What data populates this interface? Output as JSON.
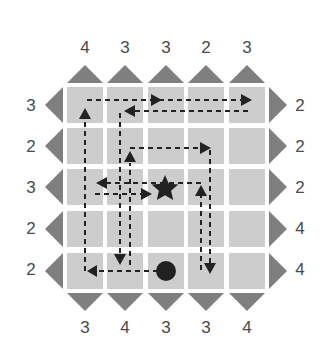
{
  "puzzle": {
    "type": "skyscraper-path-grid",
    "rows": 5,
    "cols": 5,
    "clues": {
      "top": [
        "4",
        "3",
        "3",
        "2",
        "3"
      ],
      "bottom": [
        "3",
        "4",
        "3",
        "3",
        "4"
      ],
      "left": [
        "3",
        "2",
        "3",
        "2",
        "2"
      ],
      "right": [
        "2",
        "2",
        "2",
        "4",
        "4"
      ]
    },
    "markers": {
      "start": {
        "shape": "circle",
        "row": 5,
        "col": 3
      },
      "goal": {
        "shape": "star",
        "row": 3,
        "col": 3
      }
    },
    "colors": {
      "cell": "#cdcdcd",
      "triangle": "#7f7f7f",
      "path": "#222222",
      "clue_text": "#4a4a4a"
    }
  }
}
